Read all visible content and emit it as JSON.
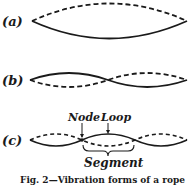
{
  "figure": {
    "panels": [
      {
        "label": "(a)",
        "mode": "fundamental",
        "loops": 1
      },
      {
        "label": "(b)",
        "mode": "second harmonic",
        "loops": 2
      },
      {
        "label": "(c)",
        "mode": "third harmonic",
        "loops": 3
      }
    ],
    "annotations": {
      "node": "Node",
      "loop": "Loop",
      "segment": "Segment"
    },
    "caption": "Fig. 2—Vibration forms of a rope",
    "colors": {
      "ink": "#1a1a1a",
      "background": "#ffffff"
    }
  }
}
